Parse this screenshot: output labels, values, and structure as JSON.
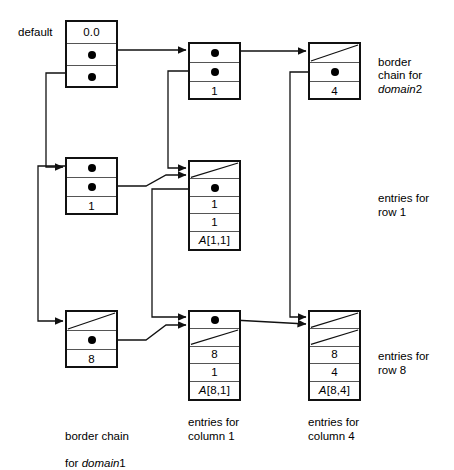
{
  "figure": {
    "labels": {
      "default": "default",
      "border_chain_domain2": "border\nchain for ",
      "border_chain_domain2_italic": "domain",
      "border_chain_domain2_num": "2",
      "entries_row1": "entries for\nrow 1",
      "entries_row8": "entries for\nrow 8",
      "border_chain_domain1_line1": "border chain",
      "border_chain_domain1_line2_pre": "for ",
      "border_chain_domain1_italic": "domain",
      "border_chain_domain1_num": "1",
      "entries_col1": "entries for\ncolumn 1",
      "entries_col4": "entries for\ncolumn 4"
    }
  },
  "nodes": [
    {
      "id": "default-node",
      "name": "default-header-node",
      "cells": [
        {
          "kind": "value",
          "text": "0.0"
        },
        {
          "kind": "pointer"
        },
        {
          "kind": "pointer"
        }
      ]
    },
    {
      "id": "domain1-row1-node",
      "name": "border-node-domain1-row1",
      "cells": [
        {
          "kind": "pointer"
        },
        {
          "kind": "pointer"
        },
        {
          "kind": "value",
          "text": "1"
        }
      ]
    },
    {
      "id": "domain1-row8-node",
      "name": "border-node-domain1-row8",
      "cells": [
        {
          "kind": "null"
        },
        {
          "kind": "pointer"
        },
        {
          "kind": "value",
          "text": "8"
        }
      ]
    },
    {
      "id": "domain2-col1-node",
      "name": "border-node-domain2-col1",
      "cells": [
        {
          "kind": "pointer"
        },
        {
          "kind": "pointer"
        },
        {
          "kind": "value",
          "text": "1"
        }
      ]
    },
    {
      "id": "domain2-col4-node",
      "name": "border-node-domain2-col4",
      "cells": [
        {
          "kind": "null"
        },
        {
          "kind": "pointer"
        },
        {
          "kind": "value",
          "text": "4"
        }
      ]
    },
    {
      "id": "entry-1-1-node",
      "name": "entry-node-a-1-1",
      "cells": [
        {
          "kind": "null"
        },
        {
          "kind": "pointer"
        },
        {
          "kind": "value",
          "text": "1"
        },
        {
          "kind": "value",
          "text": "1"
        },
        {
          "kind": "value",
          "text": "A[1,1]",
          "italic_prefix": "A",
          "rest": "[1,1]"
        }
      ]
    },
    {
      "id": "entry-8-1-node",
      "name": "entry-node-a-8-1",
      "cells": [
        {
          "kind": "pointer"
        },
        {
          "kind": "null"
        },
        {
          "kind": "value",
          "text": "8"
        },
        {
          "kind": "value",
          "text": "1"
        },
        {
          "kind": "value",
          "text": "A[8,1]",
          "italic_prefix": "A",
          "rest": "[8,1]"
        }
      ]
    },
    {
      "id": "entry-8-4-node",
      "name": "entry-node-a-8-4",
      "cells": [
        {
          "kind": "null"
        },
        {
          "kind": "null"
        },
        {
          "kind": "value",
          "text": "8"
        },
        {
          "kind": "value",
          "text": "4"
        },
        {
          "kind": "value",
          "text": "A[8,4]",
          "italic_prefix": "A",
          "rest": "[8,4]"
        }
      ]
    }
  ],
  "cell_values": {
    "default_value": "0.0",
    "d1r1_index": "1",
    "d1r8_index": "8",
    "d2c1_index": "1",
    "d2c4_index": "4",
    "e11_row": "1",
    "e11_col": "1",
    "e11_val": "A[1,1]",
    "e81_row": "8",
    "e81_col": "1",
    "e81_val": "A[8,1]",
    "e84_row": "8",
    "e84_col": "4",
    "e84_val": "A[8,4]"
  },
  "colors": {
    "stroke": "#111111",
    "inner_rule": "#555555",
    "background": "#ffffff"
  }
}
